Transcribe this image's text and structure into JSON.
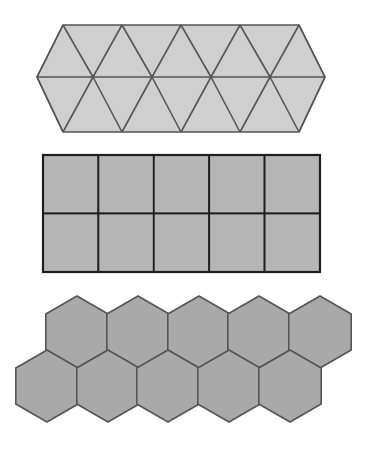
{
  "diagram": {
    "tessellations": [
      {
        "name": "triangle-tessellation",
        "shape": "equilateral-triangle",
        "rows": 2,
        "outline": "elongated hexagon",
        "fill": "#cfcfcf",
        "stroke": "#555555",
        "top_y": 25,
        "mid_y": 77,
        "bottom_y": 132,
        "top_x": [
          63,
          122,
          181,
          240,
          299
        ],
        "mid_x": [
          37,
          93,
          152,
          211,
          270,
          325
        ]
      },
      {
        "name": "square-tessellation",
        "shape": "rectangle",
        "rows": 2,
        "columns": 5,
        "fill": "#b5b5b5",
        "stroke": "#1e1e1e",
        "x": 43,
        "y": 155,
        "width": 277,
        "height": 117
      },
      {
        "name": "hexagon-tessellation",
        "shape": "regular-hexagon",
        "rows": 2,
        "per_row": 5,
        "fill": "#a9a9a9",
        "stroke": "#555555",
        "radius": 36,
        "top_row": {
          "cy": 332,
          "cx": [
            77,
            138,
            199,
            259,
            320
          ]
        },
        "bottom_row": {
          "cy": 386,
          "cx": [
            47,
            108,
            168,
            229,
            290
          ]
        }
      }
    ]
  }
}
